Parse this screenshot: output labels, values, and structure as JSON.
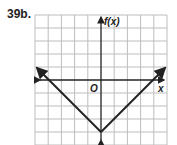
{
  "problem_label": "39b.",
  "graph": {
    "y_axis_label": "f(x)",
    "x_axis_label": "x",
    "origin_label": "O",
    "grid": {
      "columns": 10,
      "rows": 10,
      "x_range": [
        -5,
        5
      ],
      "y_range": [
        -5,
        5
      ]
    },
    "function": "f(x) = |x| - 4",
    "vertex": [
      0,
      -4
    ],
    "x_intercepts": [
      -4,
      4
    ],
    "endpoints": [
      [
        -5,
        1
      ],
      [
        5,
        1
      ]
    ],
    "colors": {
      "grid": "#bdbdbd",
      "axes": "#222222",
      "curve": "#222222"
    }
  }
}
